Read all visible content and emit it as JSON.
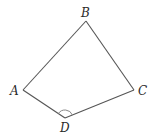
{
  "diagram": {
    "type": "quadrilateral",
    "vertices": [
      {
        "name": "A",
        "label": "A",
        "x": 23,
        "y": 90,
        "lx": 10,
        "ly": 95
      },
      {
        "name": "B",
        "label": "B",
        "x": 86,
        "y": 21,
        "lx": 81,
        "ly": 17
      },
      {
        "name": "C",
        "label": "C",
        "x": 134,
        "y": 90,
        "lx": 138,
        "ly": 95
      },
      {
        "name": "D",
        "label": "D",
        "x": 65,
        "y": 118,
        "lx": 60,
        "ly": 132
      }
    ],
    "edges": [
      [
        "A",
        "B"
      ],
      [
        "B",
        "C"
      ],
      [
        "C",
        "D"
      ],
      [
        "D",
        "A"
      ]
    ],
    "angle_marks": [
      {
        "vertex": "D",
        "radius": 8
      }
    ],
    "colors": {
      "line": "#555555",
      "label": "#2a2a2a",
      "arc": "#888888"
    }
  }
}
